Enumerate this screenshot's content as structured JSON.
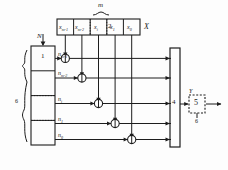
{
  "figure": {
    "ink_color": "#1d1d1d",
    "background": "#fdfdfd"
  },
  "top_register": {
    "name": "X",
    "label": "X",
    "span_label": "m",
    "ref_number": "2",
    "cells": [
      {
        "label": "x",
        "sub": "m-1"
      },
      {
        "label": "x",
        "sub": "m-2"
      },
      {
        "label": "x",
        "sub": "i"
      },
      {
        "label": "x",
        "sub": "1"
      },
      {
        "label": "x",
        "sub": "0"
      }
    ]
  },
  "left_register": {
    "input_label": "N",
    "ref_number": "1",
    "brace_label": "6",
    "rows": [
      {
        "label": "n",
        "sub": "m-1"
      },
      {
        "label": "n",
        "sub": "m-2"
      },
      {
        "label": "n",
        "sub": "i"
      },
      {
        "label": "n",
        "sub": "1"
      },
      {
        "label": "n",
        "sub": "0"
      }
    ]
  },
  "gates": {
    "name": "multiplier-nodes",
    "count": 5,
    "symbol": "circle-with-vertical-bar"
  },
  "accumulator": {
    "ref_number": "4",
    "input_arrows": 5
  },
  "output": {
    "ref_number": "5",
    "top_label": "Y",
    "bottom_label": "6",
    "style": "dashed"
  }
}
